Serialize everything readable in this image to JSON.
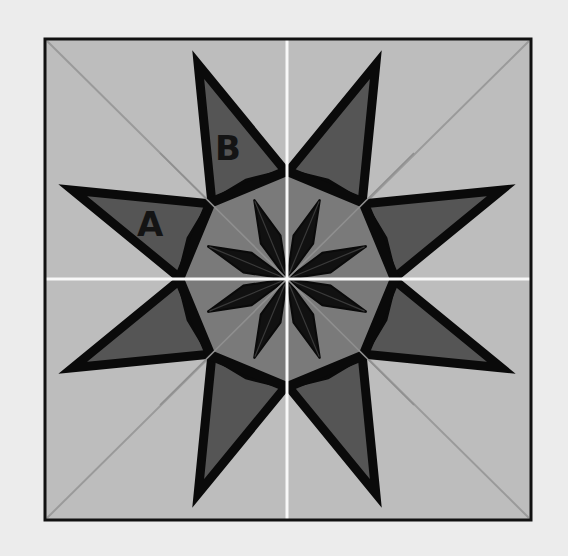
{
  "figure": {
    "labels": [
      {
        "id": "A",
        "text": "A"
      },
      {
        "id": "B",
        "text": "B"
      }
    ]
  },
  "colors": {
    "page_background": "#ececec",
    "block_background": "#bdbdbd",
    "star_points_fill": "#555555",
    "outline": "#0a0a0a",
    "octagon_inner_fill": "#7a7a7a",
    "inner_star_fill": "#111111",
    "seam_lines_axis": "#f8f8f8",
    "seam_lines_diagonal": "#9a9a9a"
  }
}
